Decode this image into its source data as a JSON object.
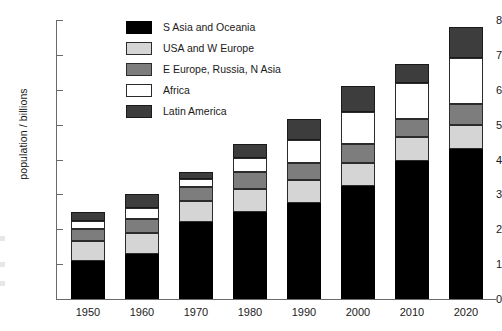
{
  "chart_data": {
    "type": "bar",
    "title": "",
    "subtitle": "",
    "xlabel": "",
    "ylabel": "population / billions",
    "stacked": true,
    "grid": false,
    "legend_position": "top-center",
    "ylim": [
      0,
      8
    ],
    "ytick_step": 1,
    "ytick_labels": [
      "8",
      "7",
      "6",
      "5",
      "4",
      "3",
      "2",
      "1",
      "0"
    ],
    "categories": [
      "1950",
      "1960",
      "1970",
      "1980",
      "1990",
      "2000",
      "2010",
      "2020"
    ],
    "series": [
      {
        "name": "S Asia and Oceania",
        "color": "#000000",
        "swatch": "seg-black",
        "values": [
          1.1,
          1.3,
          2.2,
          2.5,
          2.75,
          3.25,
          3.95,
          4.3
        ]
      },
      {
        "name": "USA and W Europe",
        "color": "#d5d5d5",
        "swatch": "seg-ltgray",
        "values": [
          0.55,
          0.6,
          0.6,
          0.65,
          0.65,
          0.65,
          0.7,
          0.7
        ]
      },
      {
        "name": "E Europe, Russia, N Asia",
        "color": "#7d7d7d",
        "swatch": "seg-mdgray",
        "values": [
          0.35,
          0.4,
          0.4,
          0.5,
          0.5,
          0.55,
          0.5,
          0.6
        ]
      },
      {
        "name": "Africa",
        "color": "#ffffff",
        "swatch": "seg-white",
        "values": [
          0.25,
          0.3,
          0.25,
          0.4,
          0.65,
          0.9,
          1.05,
          1.3
        ]
      },
      {
        "name": "Latin America",
        "color": "#3d3d3d",
        "swatch": "seg-dkgray",
        "values": [
          0.25,
          0.4,
          0.2,
          0.4,
          0.6,
          0.75,
          0.55,
          0.9
        ]
      }
    ],
    "totals": [
      2.5,
      3.0,
      3.65,
      4.45,
      5.15,
      6.1,
      6.75,
      7.8
    ]
  },
  "legend": {
    "items": [
      {
        "label": "S Asia and Oceania"
      },
      {
        "label": "USA and W Europe"
      },
      {
        "label": "E Europe, Russia, N Asia"
      },
      {
        "label": "Africa"
      },
      {
        "label": "Latin America"
      }
    ]
  }
}
